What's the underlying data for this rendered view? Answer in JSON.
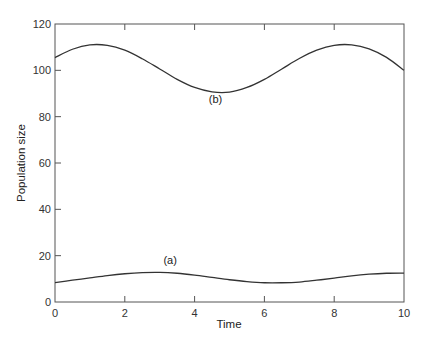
{
  "chart_data": {
    "type": "line",
    "title": "",
    "xlabel": "Time",
    "ylabel": "Population size",
    "xlim": [
      0,
      10
    ],
    "ylim": [
      0,
      120
    ],
    "xticks": [
      0,
      2,
      4,
      6,
      8,
      10
    ],
    "yticks": [
      0,
      20,
      40,
      60,
      80,
      100,
      120
    ],
    "grid": false,
    "legend": "none (inline labels)",
    "series": [
      {
        "name": "(b)",
        "label_position": {
          "x": 4.6,
          "y": 86
        },
        "x": [
          0,
          0.5,
          1,
          1.5,
          2,
          2.5,
          3,
          3.5,
          4,
          4.5,
          5,
          5.5,
          6,
          6.5,
          7,
          7.5,
          8,
          8.5,
          9,
          9.5,
          10
        ],
        "values": [
          105.5,
          109.1,
          111.0,
          110.8,
          108.7,
          105.0,
          100.6,
          96.1,
          92.6,
          90.7,
          90.6,
          92.6,
          96.1,
          100.6,
          105.1,
          108.7,
          110.8,
          111.0,
          109.3,
          105.6,
          100.0
        ]
      },
      {
        "name": "(a)",
        "label_position": {
          "x": 3.3,
          "y": 16.5
        },
        "x": [
          0,
          0.5,
          1,
          1.5,
          2,
          2.5,
          3,
          3.5,
          4,
          4.5,
          5,
          5.5,
          6,
          6.5,
          7,
          7.5,
          8,
          8.5,
          9,
          9.5,
          10
        ],
        "values": [
          8.4,
          9.4,
          10.4,
          11.4,
          12.2,
          12.7,
          12.8,
          12.4,
          11.6,
          10.6,
          9.6,
          8.8,
          8.3,
          8.3,
          8.6,
          9.4,
          10.3,
          11.3,
          12.0,
          12.4,
          12.5
        ]
      }
    ]
  }
}
